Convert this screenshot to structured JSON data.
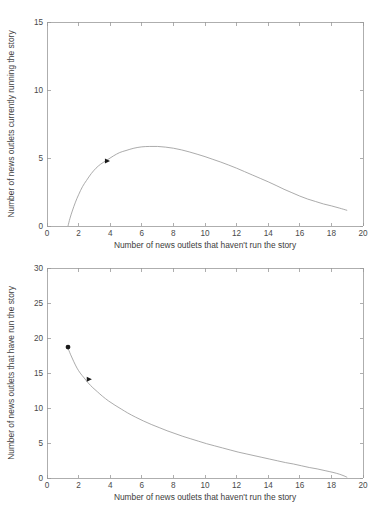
{
  "figure": {
    "background_color": "#ffffff",
    "line_color": "#8f8f8f",
    "axis_color": "#9a9a9a",
    "marker_color": "#1a1a1a"
  },
  "chart_data": [
    {
      "type": "line",
      "panel": "top",
      "title": "",
      "xlabel": "Number of news outlets that haven't run the story",
      "ylabel": "Number of news outlets currently running the story",
      "xlim": [
        0,
        20
      ],
      "ylim": [
        0,
        15
      ],
      "xticks": [
        0,
        2,
        4,
        6,
        8,
        10,
        12,
        14,
        16,
        18,
        20
      ],
      "xticklabels": [
        "0",
        "2",
        "4",
        "6",
        "8",
        "10",
        "12",
        "14",
        "16",
        "18",
        "20"
      ],
      "yticks": [
        0,
        5,
        10,
        15
      ],
      "yticklabels": [
        "0",
        "5",
        "10",
        "15"
      ],
      "grid": false,
      "legend": null,
      "series": [
        {
          "name": "trajectory",
          "x": [
            1.33,
            1.45,
            1.6,
            1.8,
            2.0,
            2.25,
            2.5,
            2.8,
            3.1,
            3.4,
            3.8,
            4.2,
            4.6,
            5.0,
            5.5,
            6.0,
            6.5,
            7.0,
            7.5,
            8.0,
            8.5,
            9.0,
            9.5,
            10.0,
            10.5,
            11.0,
            11.5,
            12.0,
            12.5,
            13.0,
            13.5,
            14.0,
            14.5,
            15.0,
            15.5,
            16.0,
            16.5,
            17.0,
            17.5,
            18.0,
            18.5,
            19.0
          ],
          "y": [
            0.0,
            0.55,
            1.1,
            1.75,
            2.3,
            2.9,
            3.35,
            3.85,
            4.25,
            4.55,
            4.85,
            5.15,
            5.4,
            5.55,
            5.72,
            5.82,
            5.85,
            5.85,
            5.8,
            5.72,
            5.6,
            5.45,
            5.28,
            5.1,
            4.9,
            4.7,
            4.48,
            4.25,
            4.0,
            3.75,
            3.5,
            3.25,
            2.98,
            2.7,
            2.45,
            2.2,
            1.98,
            1.8,
            1.62,
            1.48,
            1.32,
            1.15
          ]
        }
      ],
      "markers": [
        {
          "name": "arrow-marker",
          "shape": "triangle-right",
          "x": 3.8,
          "y": 4.78
        }
      ]
    },
    {
      "type": "line",
      "panel": "bottom",
      "title": "",
      "xlabel": "Number of news outlets that haven't run the story",
      "ylabel": "Number of news outlets that have run the story",
      "xlim": [
        0,
        20
      ],
      "ylim": [
        0,
        30
      ],
      "xticks": [
        0,
        2,
        4,
        6,
        8,
        10,
        12,
        14,
        16,
        18,
        20
      ],
      "xticklabels": [
        "0",
        "2",
        "4",
        "6",
        "8",
        "10",
        "12",
        "14",
        "16",
        "18",
        "20"
      ],
      "yticks": [
        0,
        5,
        10,
        15,
        20,
        25,
        30
      ],
      "yticklabels": [
        "0",
        "5",
        "10",
        "15",
        "20",
        "25",
        "30"
      ],
      "grid": false,
      "legend": null,
      "series": [
        {
          "name": "trajectory",
          "x": [
            1.3,
            1.5,
            1.7,
            1.9,
            2.1,
            2.35,
            2.6,
            2.9,
            3.2,
            3.5,
            3.9,
            4.3,
            4.7,
            5.1,
            5.6,
            6.1,
            6.6,
            7.1,
            7.6,
            8.1,
            8.6,
            9.1,
            9.6,
            10.1,
            10.6,
            11.1,
            11.6,
            12.1,
            12.6,
            13.1,
            13.6,
            14.1,
            14.6,
            15.1,
            15.6,
            16.1,
            16.6,
            17.1,
            17.6,
            18.1,
            18.5,
            18.8,
            19.0
          ],
          "y": [
            18.7,
            17.6,
            16.6,
            15.7,
            15.0,
            14.3,
            13.6,
            12.9,
            12.3,
            11.7,
            11.0,
            10.4,
            9.85,
            9.3,
            8.7,
            8.15,
            7.65,
            7.2,
            6.75,
            6.35,
            5.95,
            5.6,
            5.25,
            4.9,
            4.6,
            4.3,
            4.0,
            3.7,
            3.45,
            3.2,
            2.95,
            2.7,
            2.45,
            2.2,
            2.0,
            1.75,
            1.5,
            1.3,
            1.05,
            0.8,
            0.55,
            0.3,
            0.1
          ]
        }
      ],
      "markers": [
        {
          "name": "dot-marker",
          "shape": "circle",
          "x": 1.33,
          "y": 18.7
        },
        {
          "name": "arrow-marker",
          "shape": "triangle-right",
          "x": 2.65,
          "y": 14.1
        }
      ]
    }
  ]
}
